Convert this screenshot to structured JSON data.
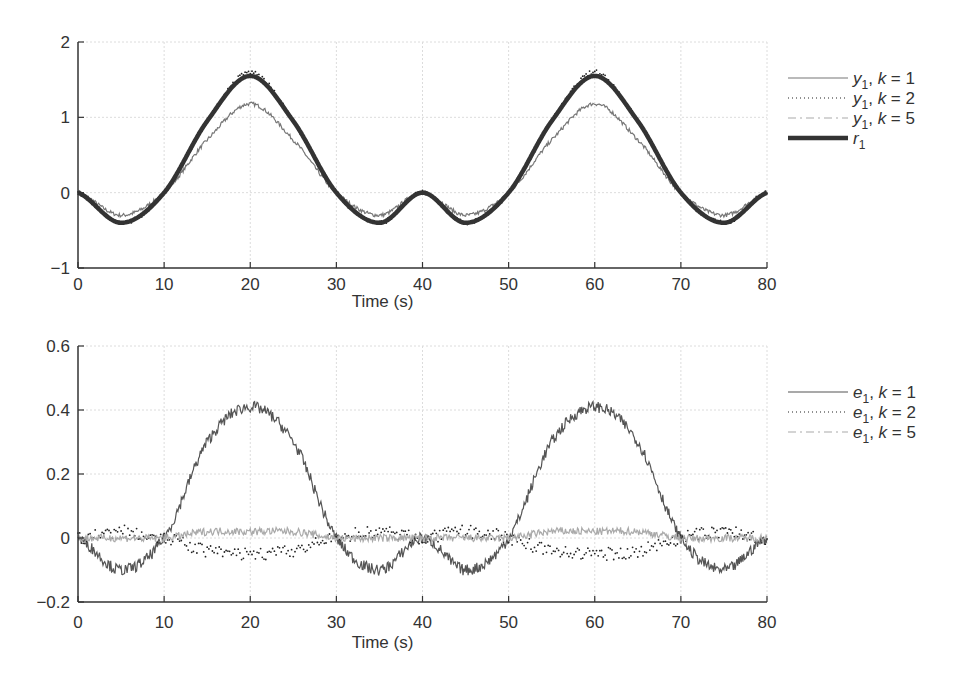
{
  "chart_data": [
    {
      "type": "line",
      "title": "",
      "xlabel": "Time (s)",
      "ylabel": "",
      "xlim": [
        0,
        80
      ],
      "ylim": [
        -1,
        2
      ],
      "xticks": [
        0,
        10,
        20,
        30,
        40,
        50,
        60,
        70,
        80
      ],
      "xtick_labels": [
        "0",
        "10",
        "20",
        "30",
        "40",
        "50",
        "60",
        "70",
        "80"
      ],
      "yticks": [
        -1,
        0,
        1,
        2
      ],
      "ytick_labels": [
        "−1",
        "0",
        "1",
        "2"
      ],
      "grid": true,
      "legend_position": "right",
      "x": [
        0,
        5,
        10,
        15,
        20,
        25,
        30,
        35,
        40,
        45,
        50,
        55,
        60,
        65,
        70,
        75,
        80
      ],
      "series": [
        {
          "name": "y1, k = 1",
          "label_main": "y",
          "label_sub": "1",
          "label_rest": ", k = 1",
          "style": "solid-thin",
          "color": "#777777",
          "values": [
            0,
            -0.3,
            0,
            0.7,
            1.18,
            0.7,
            0,
            -0.3,
            0,
            -0.3,
            0,
            0.7,
            1.18,
            0.7,
            0,
            -0.3,
            0
          ]
        },
        {
          "name": "y1, k = 2",
          "label_main": "y",
          "label_sub": "1",
          "label_rest": ", k = 2",
          "style": "dotted",
          "color": "#222222",
          "values": [
            0,
            -0.4,
            0,
            0.95,
            1.6,
            0.95,
            0,
            -0.4,
            0,
            -0.4,
            0,
            0.95,
            1.6,
            0.95,
            0,
            -0.4,
            0
          ]
        },
        {
          "name": "y1, k = 5",
          "label_main": "y",
          "label_sub": "1",
          "label_rest": ", k = 5",
          "style": "dashdot",
          "color": "#aaaaaa",
          "values": [
            0,
            -0.4,
            0,
            0.95,
            1.56,
            0.95,
            0,
            -0.4,
            0,
            -0.4,
            0,
            0.95,
            1.56,
            0.95,
            0,
            -0.4,
            0
          ]
        },
        {
          "name": "r1",
          "label_main": "r",
          "label_sub": "1",
          "label_rest": "",
          "style": "solid-thick",
          "color": "#333333",
          "values": [
            0,
            -0.4,
            0,
            0.95,
            1.55,
            0.95,
            0,
            -0.4,
            0,
            -0.4,
            0,
            0.95,
            1.55,
            0.95,
            0,
            -0.4,
            0
          ]
        }
      ]
    },
    {
      "type": "line",
      "title": "",
      "xlabel": "Time (s)",
      "ylabel": "",
      "xlim": [
        0,
        80
      ],
      "ylim": [
        -0.2,
        0.6
      ],
      "xticks": [
        0,
        10,
        20,
        30,
        40,
        50,
        60,
        70,
        80
      ],
      "xtick_labels": [
        "0",
        "10",
        "20",
        "30",
        "40",
        "50",
        "60",
        "70",
        "80"
      ],
      "yticks": [
        -0.2,
        0,
        0.2,
        0.4,
        0.6
      ],
      "ytick_labels": [
        "−0.2",
        "0",
        "0.2",
        "0.4",
        "0.6"
      ],
      "grid": true,
      "legend_position": "right",
      "x": [
        0,
        5,
        10,
        15,
        20,
        25,
        30,
        35,
        40,
        45,
        50,
        55,
        60,
        65,
        70,
        75,
        80
      ],
      "series": [
        {
          "name": "e1, k = 1",
          "label_main": "e",
          "label_sub": "1",
          "label_rest": ", k = 1",
          "style": "solid-thin",
          "color": "#555555",
          "values": [
            0,
            -0.1,
            0,
            0.3,
            0.41,
            0.3,
            0,
            -0.1,
            0,
            -0.1,
            0,
            0.3,
            0.41,
            0.3,
            0,
            -0.1,
            0
          ]
        },
        {
          "name": "e1, k = 2",
          "label_main": "e",
          "label_sub": "1",
          "label_rest": ", k = 2",
          "style": "dotted",
          "color": "#222222",
          "values": [
            0,
            0.02,
            0,
            -0.04,
            -0.05,
            -0.04,
            0,
            0.02,
            0,
            0.02,
            0,
            -0.04,
            -0.05,
            -0.04,
            0,
            0.02,
            0
          ]
        },
        {
          "name": "e1, k = 5",
          "label_main": "e",
          "label_sub": "1",
          "label_rest": ", k = 5",
          "style": "dashdot",
          "color": "#aaaaaa",
          "values": [
            0,
            0.0,
            0,
            0.02,
            0.02,
            0.02,
            0,
            0.0,
            0,
            0.0,
            0,
            0.02,
            0.02,
            0.02,
            0,
            0.0,
            0
          ]
        }
      ]
    }
  ]
}
